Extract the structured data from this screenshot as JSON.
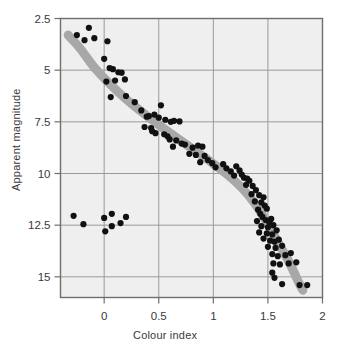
{
  "chart_data": {
    "type": "scatter",
    "title": "",
    "subtitle": "",
    "xlabel": "Colour index",
    "ylabel": "Apparent magnitude",
    "xlim": [
      -0.4,
      2.0
    ],
    "ylim": [
      2.5,
      16.0
    ],
    "y_inverted": true,
    "grid": true,
    "legend": null,
    "xticks": [
      "0",
      "0.5",
      "1",
      "1.5",
      "2"
    ],
    "xtick_values": [
      0,
      0.5,
      1,
      1.5,
      2
    ],
    "yticks": [
      "2.5",
      "5",
      "7.5",
      "10",
      "12.5",
      "15"
    ],
    "ytick_values": [
      2.5,
      5,
      7.5,
      10,
      12.5,
      15
    ],
    "plot_bg": "#efefef",
    "grid_color": "#9a9a9a",
    "frame_color": "#6e6e6e",
    "point_color": "#111111",
    "curve_color": "#a8a8a8",
    "series": [
      {
        "name": "main-sequence-stars",
        "marker": "circle",
        "color": "#111111",
        "points": [
          [
            -0.14,
            2.95
          ],
          [
            -0.25,
            3.3
          ],
          [
            -0.18,
            3.55
          ],
          [
            -0.09,
            3.45
          ],
          [
            0.03,
            3.6
          ],
          [
            0.0,
            4.45
          ],
          [
            0.05,
            4.9
          ],
          [
            0.08,
            4.95
          ],
          [
            0.13,
            5.1
          ],
          [
            0.16,
            5.12
          ],
          [
            0.02,
            5.55
          ],
          [
            0.1,
            5.5
          ],
          [
            0.19,
            5.45
          ],
          [
            0.06,
            6.3
          ],
          [
            0.2,
            6.25
          ],
          [
            0.28,
            6.55
          ],
          [
            0.34,
            6.95
          ],
          [
            0.52,
            6.7
          ],
          [
            0.39,
            7.25
          ],
          [
            0.41,
            7.22
          ],
          [
            0.46,
            7.15
          ],
          [
            0.5,
            7.3
          ],
          [
            0.56,
            7.4
          ],
          [
            0.61,
            7.5
          ],
          [
            0.64,
            7.45
          ],
          [
            0.69,
            7.48
          ],
          [
            0.37,
            7.75
          ],
          [
            0.43,
            7.8
          ],
          [
            0.44,
            7.95
          ],
          [
            0.47,
            8.05
          ],
          [
            0.55,
            8.1
          ],
          [
            0.58,
            8.2
          ],
          [
            0.6,
            8.35
          ],
          [
            0.66,
            8.4
          ],
          [
            0.71,
            8.55
          ],
          [
            0.63,
            8.7
          ],
          [
            0.74,
            8.6
          ],
          [
            0.81,
            8.75
          ],
          [
            0.86,
            8.65
          ],
          [
            0.9,
            8.7
          ],
          [
            0.78,
            9.05
          ],
          [
            0.84,
            9.1
          ],
          [
            0.92,
            9.15
          ],
          [
            0.95,
            9.35
          ],
          [
            0.88,
            9.45
          ],
          [
            0.99,
            9.5
          ],
          [
            1.02,
            9.7
          ],
          [
            1.09,
            9.55
          ],
          [
            1.12,
            9.75
          ],
          [
            1.16,
            9.9
          ],
          [
            1.21,
            9.65
          ],
          [
            1.24,
            9.85
          ],
          [
            1.19,
            10.1
          ],
          [
            1.26,
            10.05
          ],
          [
            1.28,
            10.2
          ],
          [
            1.31,
            10.25
          ],
          [
            1.33,
            10.35
          ],
          [
            1.3,
            10.55
          ],
          [
            1.36,
            10.6
          ],
          [
            1.39,
            10.8
          ],
          [
            1.35,
            11.0
          ],
          [
            1.42,
            11.05
          ],
          [
            1.46,
            11.15
          ],
          [
            1.38,
            11.35
          ],
          [
            1.44,
            11.4
          ],
          [
            1.47,
            11.55
          ],
          [
            1.41,
            11.75
          ],
          [
            1.49,
            11.7
          ],
          [
            1.43,
            11.95
          ],
          [
            1.45,
            12.1
          ],
          [
            1.4,
            12.3
          ],
          [
            1.48,
            12.25
          ],
          [
            1.51,
            12.35
          ],
          [
            1.53,
            12.2
          ],
          [
            1.44,
            12.55
          ],
          [
            1.5,
            12.6
          ],
          [
            1.55,
            12.5
          ],
          [
            1.42,
            12.85
          ],
          [
            1.49,
            12.9
          ],
          [
            1.54,
            12.95
          ],
          [
            1.58,
            12.75
          ],
          [
            1.46,
            13.15
          ],
          [
            1.52,
            13.25
          ],
          [
            1.56,
            13.3
          ],
          [
            1.6,
            13.2
          ],
          [
            1.5,
            13.55
          ],
          [
            1.57,
            13.6
          ],
          [
            1.63,
            13.5
          ],
          [
            1.54,
            13.9
          ],
          [
            1.59,
            14.0
          ],
          [
            1.66,
            13.95
          ],
          [
            1.71,
            13.85
          ],
          [
            1.55,
            14.35
          ],
          [
            1.61,
            14.4
          ],
          [
            1.69,
            14.35
          ],
          [
            1.76,
            14.3
          ],
          [
            1.54,
            14.8
          ],
          [
            1.56,
            15.05
          ],
          [
            1.63,
            15.35
          ],
          [
            1.79,
            15.4
          ],
          [
            1.86,
            15.4
          ]
        ]
      },
      {
        "name": "white-dwarf-stars",
        "marker": "circle",
        "color": "#111111",
        "points": [
          [
            -0.28,
            12.05
          ],
          [
            -0.19,
            12.45
          ],
          [
            0.0,
            12.15
          ],
          [
            0.01,
            12.8
          ],
          [
            0.07,
            11.95
          ],
          [
            0.07,
            12.55
          ],
          [
            0.15,
            12.4
          ],
          [
            0.2,
            12.1
          ]
        ]
      }
    ],
    "fitted_curve": {
      "name": "main-sequence-fit",
      "color": "#a8a8a8",
      "width_px": 9,
      "points": [
        [
          -0.33,
          3.3
        ],
        [
          -0.22,
          3.95
        ],
        [
          -0.1,
          4.8
        ],
        [
          0.04,
          5.6
        ],
        [
          0.18,
          6.3
        ],
        [
          0.34,
          7.0
        ],
        [
          0.5,
          7.65
        ],
        [
          0.66,
          8.25
        ],
        [
          0.82,
          8.85
        ],
        [
          0.98,
          9.45
        ],
        [
          1.14,
          10.1
        ],
        [
          1.28,
          10.8
        ],
        [
          1.4,
          11.6
        ],
        [
          1.5,
          12.45
        ],
        [
          1.6,
          13.4
        ],
        [
          1.7,
          14.35
        ],
        [
          1.78,
          15.25
        ],
        [
          1.82,
          15.65
        ]
      ]
    }
  }
}
